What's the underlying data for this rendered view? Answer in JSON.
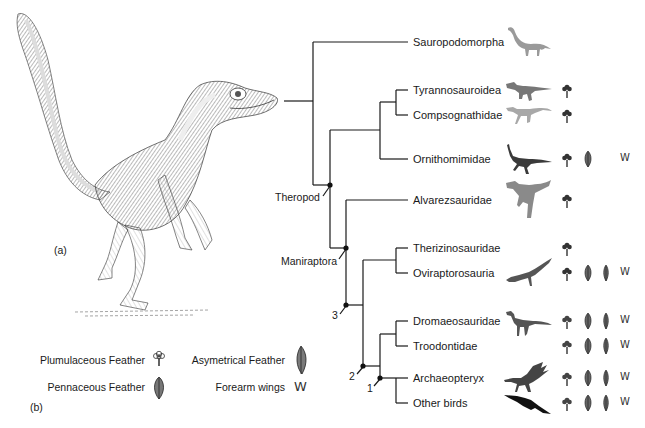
{
  "panels": {
    "a": "(a)",
    "b": "(b)"
  },
  "illustration": {
    "subject": "feathered-theropod-dinosaur",
    "style": "pen-and-ink stipple"
  },
  "tree": {
    "taxa": [
      {
        "name": "Sauropodomorpha",
        "silhouette": "sauropod",
        "traits": {
          "plumulaceous": false,
          "pennaceous": false,
          "asymmetrical": false,
          "forearm_wings": false
        }
      },
      {
        "name": "Tyrannosauroidea",
        "silhouette": "tyrannosaur",
        "traits": {
          "plumulaceous": true,
          "pennaceous": false,
          "asymmetrical": false,
          "forearm_wings": false
        }
      },
      {
        "name": "Compsognathidae",
        "silhouette": "compsognathid",
        "traits": {
          "plumulaceous": true,
          "pennaceous": false,
          "asymmetrical": false,
          "forearm_wings": false
        }
      },
      {
        "name": "Ornithomimidae",
        "silhouette": "ornithomimid",
        "traits": {
          "plumulaceous": true,
          "pennaceous": true,
          "asymmetrical": false,
          "forearm_wings": true
        }
      },
      {
        "name": "Alvarezsauridae",
        "silhouette": "alvarezsaurid",
        "traits": {
          "plumulaceous": true,
          "pennaceous": false,
          "asymmetrical": false,
          "forearm_wings": false
        }
      },
      {
        "name": "Therizinosauridae",
        "silhouette": "",
        "traits": {
          "plumulaceous": true,
          "pennaceous": false,
          "asymmetrical": false,
          "forearm_wings": false
        }
      },
      {
        "name": "Oviraptorosauria",
        "silhouette": "oviraptorosaur",
        "traits": {
          "plumulaceous": true,
          "pennaceous": true,
          "asymmetrical": true,
          "forearm_wings": true
        }
      },
      {
        "name": "Dromaeosauridae",
        "silhouette": "dromaeosaur",
        "traits": {
          "plumulaceous": true,
          "pennaceous": true,
          "asymmetrical": true,
          "forearm_wings": true
        }
      },
      {
        "name": "Troodontidae",
        "silhouette": "",
        "traits": {
          "plumulaceous": true,
          "pennaceous": true,
          "asymmetrical": true,
          "forearm_wings": true
        }
      },
      {
        "name": "Archaeopteryx",
        "silhouette": "archaeopteryx",
        "traits": {
          "plumulaceous": true,
          "pennaceous": true,
          "asymmetrical": true,
          "forearm_wings": true
        }
      },
      {
        "name": "Other birds",
        "silhouette": "flying-bird",
        "traits": {
          "plumulaceous": true,
          "pennaceous": true,
          "asymmetrical": true,
          "forearm_wings": true
        }
      }
    ],
    "nodes": {
      "theropod": "Theropod",
      "maniraptora": "Maniraptora",
      "n3": "3",
      "n2": "2",
      "n1": "1"
    }
  },
  "legend": {
    "plumulaceous": "Plumulaceous Feather",
    "pennaceous": "Pennaceous Feather",
    "asymmetrical": "Asymetrical Feather",
    "forearm_wings": "Forearm wings",
    "forearm_glyph": "W"
  },
  "colors": {
    "line": "#1a1a1a",
    "icon": "#3a3a3a",
    "silhouette_light": "#9a9a9a",
    "silhouette_mid": "#7a7a7a",
    "silhouette_dark": "#2a2a2a"
  }
}
